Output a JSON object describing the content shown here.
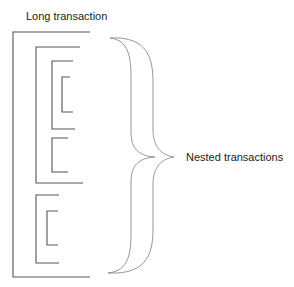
{
  "diagram": {
    "title": "Long transaction",
    "brace_label": "Nested transactions",
    "colors": {
      "line": "#555555",
      "brace": "#8a8a8a",
      "text": "#222222",
      "background": "#ffffff"
    },
    "brackets": [
      {
        "name": "long-transaction",
        "x": 13,
        "top": 32,
        "bottom": 277,
        "top_end": 90,
        "bottom_end": 90,
        "level": 0
      },
      {
        "name": "nested-transaction-1",
        "x": 36,
        "top": 47,
        "bottom": 183,
        "top_end": 80,
        "bottom_end": 83,
        "level": 1
      },
      {
        "name": "nested-transaction-1-1",
        "x": 52,
        "top": 61,
        "bottom": 129,
        "top_end": 73,
        "bottom_end": 75,
        "level": 2
      },
      {
        "name": "nested-transaction-1-1-1",
        "x": 62,
        "top": 77,
        "bottom": 112,
        "top_end": 70,
        "bottom_end": 73,
        "level": 3
      },
      {
        "name": "nested-transaction-1-2",
        "x": 52,
        "top": 138,
        "bottom": 172,
        "top_end": 68,
        "bottom_end": 68,
        "level": 2
      },
      {
        "name": "nested-transaction-2",
        "x": 36,
        "top": 195,
        "bottom": 263,
        "top_end": 59,
        "bottom_end": 59,
        "level": 1
      },
      {
        "name": "nested-transaction-2-1",
        "x": 47,
        "top": 211,
        "bottom": 245,
        "top_end": 58,
        "bottom_end": 58,
        "level": 2
      }
    ],
    "brace": {
      "top": 38,
      "bottom": 273,
      "mid_y": 157,
      "left_x": 110,
      "stem_inner_x": 131,
      "stem_outer_x": 153,
      "tip_inner_x": 155,
      "tip_outer_x": 174
    }
  }
}
